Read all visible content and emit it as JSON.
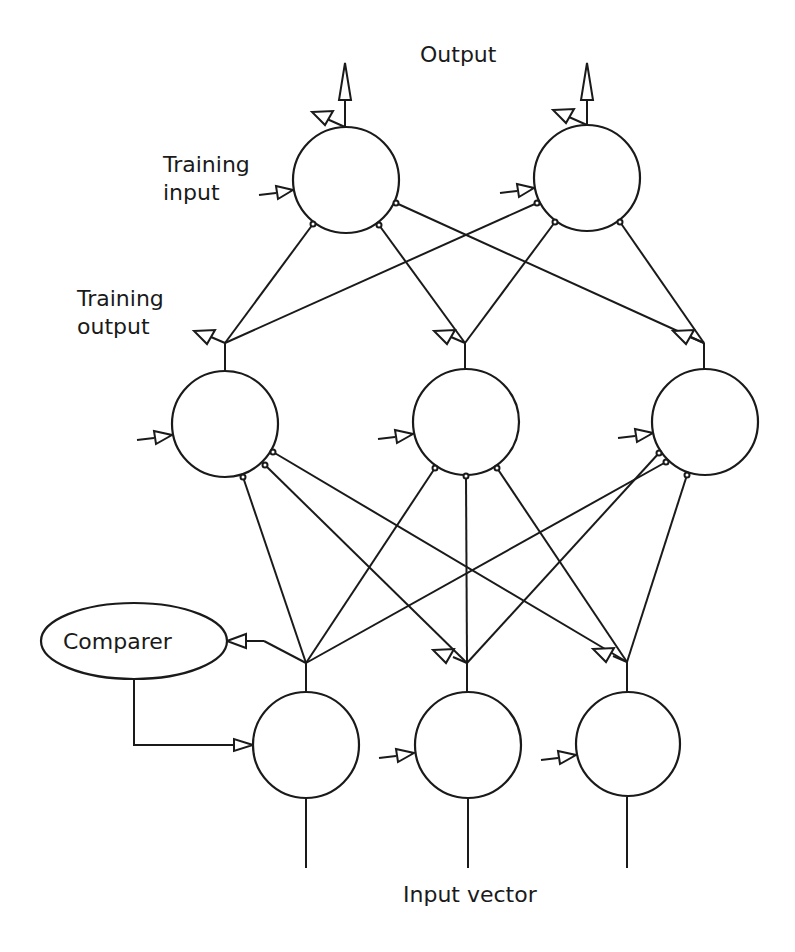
{
  "diagram": {
    "labels": {
      "output": "Output",
      "training_input_line1": "Training",
      "training_input_line2": "input",
      "training_output_line1": "Training",
      "training_output_line2": "output",
      "comparer": "Comparer",
      "input_vector": "Input vector"
    },
    "layers": {
      "output_layer": [
        {
          "id": "o1",
          "cx": 346,
          "cy": 180,
          "r": 53
        },
        {
          "id": "o2",
          "cx": 587,
          "cy": 178,
          "r": 53
        }
      ],
      "hidden_layer": [
        {
          "id": "h1",
          "cx": 225,
          "cy": 424,
          "r": 53
        },
        {
          "id": "h2",
          "cx": 466,
          "cy": 422,
          "r": 53
        },
        {
          "id": "h3",
          "cx": 705,
          "cy": 422,
          "r": 53
        }
      ],
      "input_layer": [
        {
          "id": "i1",
          "cx": 306,
          "cy": 745,
          "r": 53
        },
        {
          "id": "i2",
          "cx": 468,
          "cy": 745,
          "r": 53
        },
        {
          "id": "i3",
          "cx": 628,
          "cy": 744,
          "r": 52
        }
      ]
    },
    "comparer_node": {
      "cx": 134,
      "cy": 641,
      "rx": 93,
      "ry": 38
    },
    "connections": "fully connected between adjacent layers",
    "colors": {
      "stroke": "#1a1a1a",
      "background": "#ffffff"
    }
  }
}
